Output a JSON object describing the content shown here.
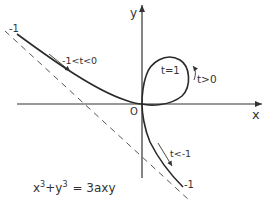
{
  "diagram": {
    "equation": "x³ + y³ = 3axy",
    "equation_parts": {
      "x": "x",
      "xexp": "3",
      "plus": "+",
      "y": "y",
      "yexp": "3",
      "rhs": "=  3axy"
    },
    "axes": {
      "x_label": "x",
      "y_label": "y",
      "origin_label": "O"
    },
    "annotations": {
      "left_end": "-1",
      "left_range": "-1<t<0",
      "loop_point": "t=1",
      "loop_range": "t>0",
      "lower_range": "t<-1",
      "lower_end": "-1"
    },
    "colors": {
      "curve": "#2a2a2a",
      "axis": "#333333",
      "asymptote": "#555555",
      "text": "#333333"
    }
  }
}
